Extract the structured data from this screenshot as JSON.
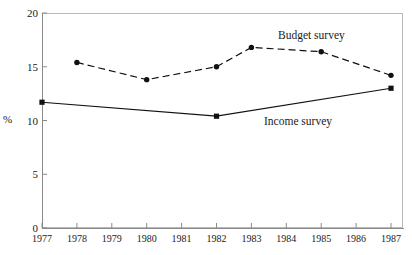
{
  "chart_data": {
    "type": "line",
    "title": "",
    "subtitle": "",
    "xlabel": "",
    "ylabel": "%",
    "xlim": [
      1977,
      1987
    ],
    "ylim": [
      0,
      20
    ],
    "yticks": [
      0,
      5,
      10,
      15,
      20
    ],
    "xticks": [
      1977,
      1978,
      1979,
      1980,
      1981,
      1982,
      1983,
      1984,
      1985,
      1986,
      1987
    ],
    "xtick_labels": [
      "1977",
      "1978",
      "1979",
      "1980",
      "1981",
      "1982",
      "1983",
      "1984",
      "1985",
      "1986",
      "1987"
    ],
    "ytick_labels": [
      "0",
      "5",
      "10",
      "15",
      "20"
    ],
    "grid": false,
    "legend_position": "inline-annotation",
    "series": [
      {
        "name": "Budget survey",
        "linestyle": "dashed",
        "marker": "filled-circle",
        "color": "#111111",
        "x": [
          1978,
          1980,
          1982,
          1983,
          1985,
          1987
        ],
        "values": [
          15.4,
          13.8,
          15.0,
          16.8,
          16.4,
          14.2
        ]
      },
      {
        "name": "Income survey",
        "linestyle": "solid",
        "marker": "filled-square",
        "color": "#111111",
        "x": [
          1977,
          1982,
          1987
        ],
        "values": [
          11.7,
          10.4,
          13.0
        ]
      }
    ],
    "annotations": [
      {
        "text": "Budget survey",
        "x": 1985.2,
        "y": 18.5
      },
      {
        "text": "Income survey",
        "x": 1983.6,
        "y": 10.6
      }
    ]
  },
  "axis": {
    "y_label": "%",
    "y_ticks": [
      "20",
      "15",
      "10",
      "5",
      "0"
    ],
    "x_ticks": [
      "1977",
      "1978",
      "1979",
      "1980",
      "1981",
      "1982",
      "1983",
      "1984",
      "1985",
      "1986",
      "1987"
    ]
  },
  "labels": {
    "budget_survey": "Budget survey",
    "income_survey": "Income survey"
  },
  "colors": {
    "ink": "#111111",
    "frame": "#b9b9b9",
    "axis": "#8a8a8a",
    "background": "#ffffff"
  }
}
